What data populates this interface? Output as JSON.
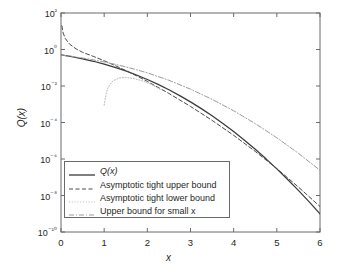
{
  "chart_data": {
    "type": "line",
    "title": "",
    "xlabel": "x",
    "ylabel": "Q(x)",
    "xlim": [
      0,
      6
    ],
    "ylim": [
      1e-10,
      100
    ],
    "yscale": "log",
    "xscale": "linear",
    "grid": false,
    "legend_position": "lower-left-inside",
    "xticks": [
      "0",
      "1",
      "2",
      "3",
      "4",
      "5",
      "6"
    ],
    "yticks": [
      "10²",
      "10⁰",
      "10⁻²",
      "10⁻⁴",
      "10⁻⁶",
      "10⁻⁸",
      "10⁻¹⁰"
    ],
    "ytick_values": [
      100,
      1,
      0.01,
      0.0001,
      1e-06,
      1e-08,
      1e-10
    ],
    "series": [
      {
        "name": "Q(x)",
        "style": "solid",
        "color": "#3a3a3a",
        "x": [
          0,
          0.25,
          0.5,
          0.75,
          1,
          1.25,
          1.5,
          1.75,
          2,
          2.25,
          2.5,
          2.75,
          3,
          3.25,
          3.5,
          3.75,
          4,
          4.25,
          4.5,
          4.75,
          5,
          5.25,
          5.5,
          5.75,
          6
        ],
        "y": [
          0.5,
          0.4013,
          0.3085,
          0.2266,
          0.1587,
          0.1056,
          0.0668,
          0.0401,
          0.02275,
          0.01222,
          0.00621,
          0.00298,
          0.00135,
          0.000577,
          0.0002326,
          8.84e-05,
          3.167e-05,
          1.07e-05,
          3.4e-06,
          1.02e-06,
          2.87e-07,
          7.6e-08,
          1.9e-08,
          4.46e-09,
          9.87e-10
        ]
      },
      {
        "name": "Asymptotic tight upper bound",
        "style": "dashed",
        "color": "#4a4a4a",
        "x": [
          0.02,
          0.05,
          0.1,
          0.2,
          0.35,
          0.5,
          0.75,
          1,
          1.25,
          1.5,
          1.75,
          2,
          2.5,
          3,
          3.5,
          4,
          4.5,
          5,
          5.5,
          6
        ],
        "y": [
          19.9,
          7.97,
          3.97,
          1.95,
          1.08,
          0.7,
          0.42,
          0.242,
          0.133,
          0.0705,
          0.0361,
          0.0179,
          0.0039,
          0.00076,
          0.000131,
          1.98e-05,
          2.6e-06,
          2.97e-07,
          2.9e-08,
          2.5e-09
        ]
      },
      {
        "name": "Asymptotic tight lower bound",
        "style": "dotted",
        "color": "#b9b9b9",
        "x": [
          1.0,
          1.05,
          1.1,
          1.2,
          1.35,
          1.5,
          1.7,
          1.9,
          2.1,
          2.3
        ],
        "y": [
          0.0009,
          0.0042,
          0.0094,
          0.019,
          0.0275,
          0.0295,
          0.0255,
          0.0185,
          0.0118,
          0.0065
        ]
      },
      {
        "name": "Upper bound for small x",
        "style": "dashdot",
        "color": "#9a9a9a",
        "x": [
          0,
          0.25,
          0.5,
          0.75,
          1,
          1.25,
          1.5,
          1.75,
          2,
          2.5,
          3,
          3.5,
          4,
          4.5,
          5,
          5.5,
          6
        ],
        "y": [
          0.5,
          0.4208,
          0.3425,
          0.2708,
          0.2079,
          0.1548,
          0.1116,
          0.0779,
          0.0526,
          0.0206,
          0.0067,
          0.00186,
          0.00044,
          8.7e-05,
          1.46e-05,
          2.05e-06,
          2.4e-07
        ]
      }
    ]
  },
  "axis": {
    "x_label": "x",
    "y_label": "Q(x)"
  },
  "legend": {
    "entries": [
      {
        "label": "Q(x)",
        "style": "solid"
      },
      {
        "label": "Asymptotic tight upper bound",
        "style": "dashed"
      },
      {
        "label": "Asymptotic tight lower bound",
        "style": "dotted"
      },
      {
        "label": "Upper bound for small x",
        "style": "dashdot"
      }
    ]
  },
  "colors": {
    "axis": "#6a6a6a",
    "text": "#1f1f1f",
    "curve_main": "#3a3a3a",
    "curve_upper": "#4a4a4a",
    "curve_lower": "#b9b9b9",
    "curve_small_x": "#9a9a9a",
    "background": "#ffffff"
  }
}
